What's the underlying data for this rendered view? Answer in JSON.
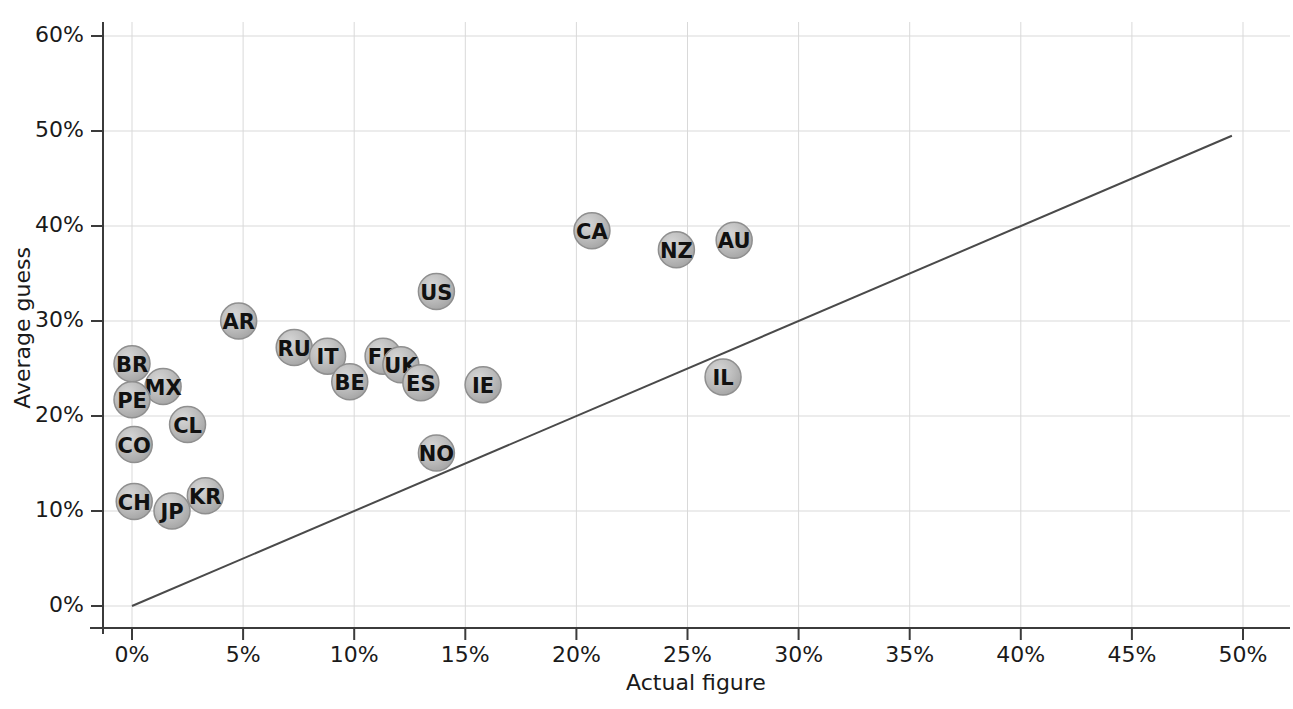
{
  "chart_data": {
    "type": "scatter",
    "title": "",
    "xlabel": "Actual figure",
    "ylabel": "Average guess",
    "xlim": [
      0,
      50
    ],
    "ylim": [
      0,
      60
    ],
    "grid": true,
    "legend": false,
    "x_unit": "%",
    "y_unit": "%",
    "xticks": [
      0,
      5,
      10,
      15,
      20,
      25,
      30,
      35,
      40,
      45,
      50
    ],
    "xtick_labels": [
      "0%",
      "5%",
      "10%",
      "15%",
      "20%",
      "25%",
      "30%",
      "35%",
      "40%",
      "45%",
      "50%"
    ],
    "yticks": [
      0,
      10,
      20,
      30,
      40,
      50,
      60
    ],
    "ytick_labels": [
      "0%",
      "10%",
      "20%",
      "30%",
      "40%",
      "50%",
      "60%"
    ],
    "reference_line": {
      "name": "identity-line",
      "description": "y = x diagonal",
      "x0": 0,
      "y0": 0,
      "x1": 49.5,
      "y1": 49.5,
      "color": "#4a4a4a"
    },
    "marker_style": {
      "shape": "circle",
      "radius_px": 18,
      "fill": "#b3b3b3",
      "stroke": "#8f8f8f",
      "label_color": "#111111"
    },
    "points": [
      {
        "label": "BR",
        "x": 0.0,
        "y": 25.5
      },
      {
        "label": "MX",
        "x": 1.4,
        "y": 23.1
      },
      {
        "label": "PE",
        "x": 0.0,
        "y": 21.7
      },
      {
        "label": "CL",
        "x": 2.5,
        "y": 19.1
      },
      {
        "label": "CO",
        "x": 0.1,
        "y": 17.0
      },
      {
        "label": "CH",
        "x": 0.1,
        "y": 11.0
      },
      {
        "label": "KR",
        "x": 3.3,
        "y": 11.6
      },
      {
        "label": "JP",
        "x": 1.8,
        "y": 10.0
      },
      {
        "label": "AR",
        "x": 4.8,
        "y": 30.0
      },
      {
        "label": "RU",
        "x": 7.3,
        "y": 27.2
      },
      {
        "label": "IT",
        "x": 8.8,
        "y": 26.3
      },
      {
        "label": "BE",
        "x": 9.8,
        "y": 23.6
      },
      {
        "label": "FR",
        "x": 11.3,
        "y": 26.3
      },
      {
        "label": "UK",
        "x": 12.1,
        "y": 25.4
      },
      {
        "label": "ES",
        "x": 13.0,
        "y": 23.5
      },
      {
        "label": "US",
        "x": 13.7,
        "y": 33.1
      },
      {
        "label": "NO",
        "x": 13.7,
        "y": 16.1
      },
      {
        "label": "IE",
        "x": 15.8,
        "y": 23.3
      },
      {
        "label": "CA",
        "x": 20.7,
        "y": 39.5
      },
      {
        "label": "NZ",
        "x": 24.5,
        "y": 37.5
      },
      {
        "label": "AU",
        "x": 27.1,
        "y": 38.5
      },
      {
        "label": "IL",
        "x": 26.6,
        "y": 24.1
      }
    ]
  }
}
